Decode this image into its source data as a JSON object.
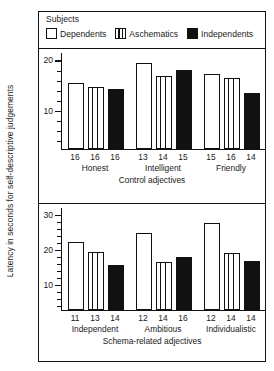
{
  "ylabel": "Latency in seconds for self-descriptive judgements",
  "legend": {
    "title": "Subjects",
    "items": [
      {
        "label": "Dependents",
        "style": "open",
        "icon": "open-square-icon"
      },
      {
        "label": "Aschematics",
        "style": "striped",
        "icon": "striped-square-icon"
      },
      {
        "label": "Independents",
        "style": "solid",
        "icon": "filled-square-icon"
      }
    ]
  },
  "chart_data": [
    {
      "id": "control",
      "type": "bar",
      "title": "",
      "xlabel": "Control adjectives",
      "ylabel": "Latency in seconds for self-descriptive judgements",
      "ylim": [
        2.5,
        21.5
      ],
      "yticks_major": [
        10,
        20
      ],
      "yticks_major_labels": [
        "10",
        "20"
      ],
      "yticks_minor": [
        4,
        6,
        8,
        12,
        14,
        16,
        18
      ],
      "grid": false,
      "legend_position": "top",
      "categories": [
        "Honest",
        "Intelligent",
        "Friendly"
      ],
      "series": [
        {
          "name": "Dependents",
          "style": "open",
          "values": [
            15.5,
            19.5,
            17.3
          ]
        },
        {
          "name": "Aschematics",
          "style": "striped",
          "values": [
            14.7,
            17.0,
            16.6
          ]
        },
        {
          "name": "Independents",
          "style": "solid",
          "values": [
            14.3,
            18.2,
            13.5
          ]
        }
      ],
      "bar_annotations": [
        [
          "16",
          "16",
          "16"
        ],
        [
          "13",
          "14",
          "15"
        ],
        [
          "15",
          "16",
          "14"
        ]
      ]
    },
    {
      "id": "schema-related",
      "type": "bar",
      "title": "",
      "xlabel": "Schema-related adjectives",
      "ylabel": "Latency in seconds for self-descriptive judgements",
      "ylim": [
        3.0,
        32.0
      ],
      "yticks_major": [
        10,
        20,
        30
      ],
      "yticks_major_labels": [
        "10",
        "20",
        "30"
      ],
      "yticks_minor": [
        4,
        6,
        8,
        12,
        14,
        16,
        18,
        22,
        24,
        26,
        28
      ],
      "grid": false,
      "legend_position": "top",
      "categories": [
        "Independent",
        "Ambitious",
        "Individualistic"
      ],
      "series": [
        {
          "name": "Dependents",
          "style": "open",
          "values": [
            22.3,
            24.8,
            27.8
          ]
        },
        {
          "name": "Aschematics",
          "style": "striped",
          "values": [
            19.5,
            16.6,
            19.2
          ]
        },
        {
          "name": "Independents",
          "style": "solid",
          "values": [
            15.8,
            18.0,
            16.8
          ]
        }
      ],
      "bar_annotations": [
        [
          "11",
          "13",
          "14"
        ],
        [
          "12",
          "14",
          "16"
        ],
        [
          "12",
          "14",
          "14"
        ]
      ]
    }
  ]
}
